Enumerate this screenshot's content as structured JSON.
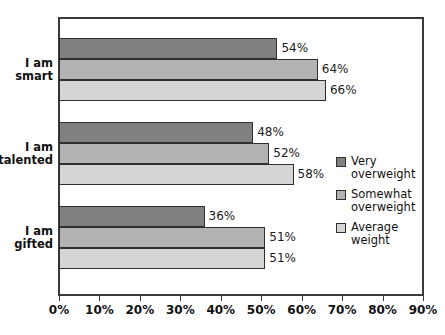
{
  "chart_data": {
    "type": "bar",
    "orientation": "horizontal",
    "title": "",
    "xlabel": "",
    "ylabel": "",
    "xlim": [
      0,
      90
    ],
    "xticks": [
      "0%",
      "10%",
      "20%",
      "30%",
      "40%",
      "50%",
      "60%",
      "70%",
      "80%",
      "90%"
    ],
    "xtick_values": [
      0,
      10,
      20,
      30,
      40,
      50,
      60,
      70,
      80,
      90
    ],
    "grid": false,
    "legend_position": "right",
    "categories": [
      "I am smart",
      "I am talented",
      "I am gifted"
    ],
    "category_lines": [
      [
        "I am",
        "smart"
      ],
      [
        "I am",
        "talented"
      ],
      [
        "I am",
        "gifted"
      ]
    ],
    "series": [
      {
        "name": "Very overweight",
        "name_lines": [
          "Very",
          "overweight"
        ],
        "color": "#808080",
        "values": [
          54,
          48,
          36
        ],
        "labels": [
          "54%",
          "48%",
          "36%"
        ]
      },
      {
        "name": "Somewhat overweight",
        "name_lines": [
          "Somewhat",
          "overweight"
        ],
        "color": "#b3b3b3",
        "values": [
          64,
          52,
          51
        ],
        "labels": [
          "64%",
          "52%",
          "51%"
        ]
      },
      {
        "name": "Average weight",
        "name_lines": [
          "Average",
          "weight"
        ],
        "color": "#d5d5d5",
        "values": [
          66,
          58,
          51
        ],
        "labels": [
          "66%",
          "58%",
          "51%"
        ]
      }
    ]
  },
  "legend": {
    "items": [
      {
        "label_line1": "Very",
        "label_line2": "overweight"
      },
      {
        "label_line1": "Somewhat",
        "label_line2": "overweight"
      },
      {
        "label_line1": "Average",
        "label_line2": "weight"
      }
    ]
  },
  "colors": {
    "series_very_overweight": "#808080",
    "series_somewhat_overweight": "#b3b3b3",
    "series_average_weight": "#d5d5d5",
    "frame": "#3a3a3a",
    "text": "#111111",
    "background": "#ffffff"
  }
}
